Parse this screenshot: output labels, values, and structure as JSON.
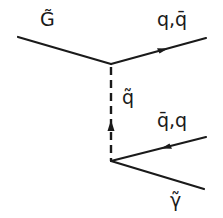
{
  "diagram": {
    "type": "Feynman diagram",
    "labels": {
      "gluino": "G̃",
      "outgoing_quark": "q,q̄",
      "squark": "q̃",
      "incoming_antiquark": "q̄,q",
      "photino": "γ̃"
    },
    "vertices": [
      {
        "id": "v1",
        "x": 111,
        "y": 64
      },
      {
        "id": "v2",
        "x": 111,
        "y": 161
      }
    ],
    "lines": [
      {
        "id": "gluino-line",
        "from": [
          18,
          37
        ],
        "to": [
          111,
          64
        ],
        "style": "solid",
        "arrow": "none",
        "label": "G̃"
      },
      {
        "id": "quark-out-line",
        "from": [
          111,
          64
        ],
        "to": [
          206,
          38
        ],
        "style": "solid",
        "arrow": "forward",
        "label": "q,q̄"
      },
      {
        "id": "squark-propagator",
        "from": [
          111,
          161
        ],
        "to": [
          111,
          64
        ],
        "style": "dashed",
        "arrow": "up",
        "label": "q̃"
      },
      {
        "id": "quark-in-line",
        "from": [
          206,
          137
        ],
        "to": [
          111,
          161
        ],
        "style": "solid",
        "arrow": "toward-vertex",
        "label": "q̄,q"
      },
      {
        "id": "photino-line",
        "from": [
          111,
          161
        ],
        "to": [
          204,
          189
        ],
        "style": "solid",
        "arrow": "none",
        "label": "γ̃"
      }
    ],
    "colors": {
      "ink": "#1a1a1a",
      "background": "#ffffff"
    }
  }
}
